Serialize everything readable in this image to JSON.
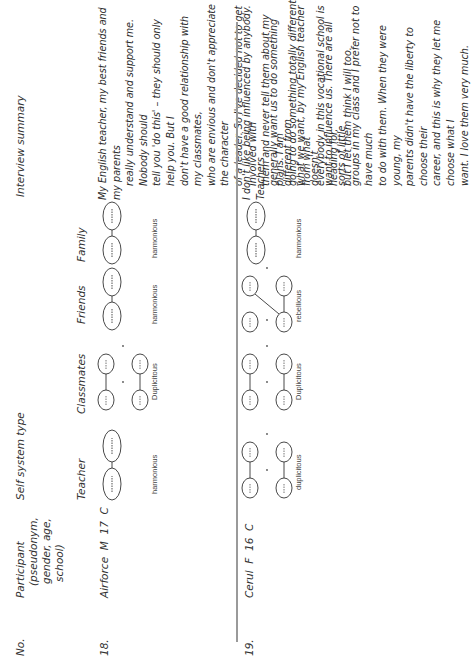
{
  "table": {
    "headers": {
      "no": "No.",
      "participant_lines": [
        "Participant",
        "(pseudonym,",
        "gender, age,",
        "school)"
      ],
      "self_system_type": "Self system type",
      "sub": {
        "teacher": "Teacher",
        "classmates": "Classmates",
        "friends": "Friends",
        "family": "Family"
      },
      "interview_summary": "Interview summary"
    },
    "rows": [
      {
        "no": "18.",
        "participant": "Airforce  M  17  C",
        "teacher": {
          "type": "harmonious",
          "diagram": "single-pair"
        },
        "classmates": {
          "type": "Duplicitous",
          "diagram": "split-pairs"
        },
        "friends": {
          "type": "harmonious",
          "diagram": "single-pair"
        },
        "family": {
          "type": "harmonious",
          "diagram": "single-pair"
        },
        "summary_lines": [
          "My English teacher, my best friends and my parents",
          "really understand and support me. Nobody should",
          "tell you 'do this' – they should only help you. But I",
          "don't have a good relationship with my classmates,",
          "who are envious and don't appreciate the character",
          "of a leader. So I've decided not to get involved with",
          "them and never tell them about my plans. I am",
          "going to do something totally different from what",
          "everybody in this vocational school is heading for,",
          "but I let them think I will too."
        ]
      },
      {
        "no": "19.",
        "participant": "Cerul  F  16  C",
        "teacher": {
          "type": "duplicitous",
          "diagram": "split-pairs"
        },
        "classmates": {
          "type": "Duplicitous",
          "diagram": "split-pairs"
        },
        "friends": {
          "type": "rebellious",
          "diagram": "crossed"
        },
        "family": {
          "type": "harmonious",
          "diagram": "single-pair"
        },
        "summary_lines": [
          "I don't like being influenced by anybody. Teachers",
          "generally want us to do something different from",
          "what we want, by my English teacher doesn't",
          "want to influence us. There are all sorts of little",
          "groups in my class and I prefer not to have much",
          "to do with them. When they were young, my",
          "parents didn't have the liberty to choose their",
          "career, and this is why they let me choose what I",
          "want. I love them very much."
        ]
      }
    ]
  },
  "colors": {
    "text": "#2a2a2a",
    "divider": "#9a9a9a",
    "diagram_stroke": "#333333"
  }
}
